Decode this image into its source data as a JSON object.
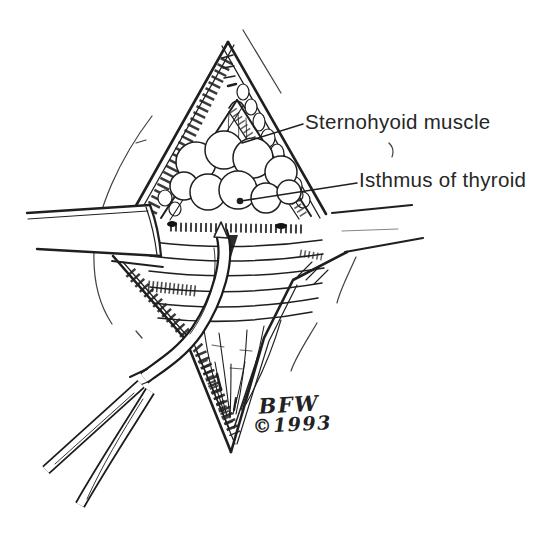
{
  "figure": {
    "labels": {
      "sternohyoid": "Sternohyoid muscle",
      "isthmus": "Isthmus of thyroid"
    },
    "signature": {
      "initials": "BFW",
      "year": "©1993"
    },
    "colors": {
      "ink": "#1f1f1f",
      "paper": "#ffffff"
    }
  }
}
